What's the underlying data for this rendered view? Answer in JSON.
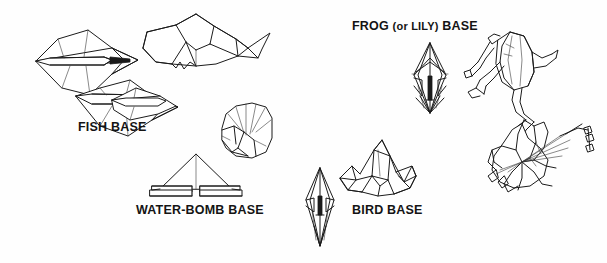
{
  "illustration": {
    "title": "Origami Bases",
    "background_color": "#fefefe",
    "ink_color": "#1b1b1b",
    "width": 607,
    "height": 263
  },
  "captions": {
    "fish_base": "FISH BASE",
    "water_bomb_base": "WATER-BOMB BASE",
    "bird_base": "BIRD BASE",
    "frog_base_full": "FROG (or LILY) BASE",
    "frog_base_part1": "FROG",
    "frog_base_part2": "(or LILY)",
    "frog_base_part3": "BASE"
  },
  "figures": [
    {
      "id": "fish-base-upper",
      "name": "fish-base-diagram-upper",
      "caption_group": "fish_base",
      "description": "Folded fish base, upper left, kite-shaped with central flap"
    },
    {
      "id": "fish-base-lower",
      "name": "fish-base-diagram-lower",
      "caption_group": "fish_base",
      "description": "Folded fish base, lower, kite-shaped with central flap"
    },
    {
      "id": "fish-model",
      "name": "fish-model-figure",
      "caption_group": "fish_base",
      "description": "Completed origami fish folded from the fish base"
    },
    {
      "id": "water-bomb-base",
      "name": "water-bomb-base-diagram",
      "caption_group": "water_bomb_base",
      "description": "Triangular water-bomb base with layered flaps"
    },
    {
      "id": "water-bomb-balloon",
      "name": "water-bomb-balloon-figure",
      "caption_group": "water_bomb_base",
      "description": "Inflated paper balloon folded from the water-bomb base"
    },
    {
      "id": "bird-base",
      "name": "bird-base-diagram",
      "caption_group": "bird_base",
      "description": "Slender diamond bird base with points"
    },
    {
      "id": "crane-model",
      "name": "crane-model-figure",
      "caption_group": "bird_base",
      "description": "Completed paper crane folded from the bird base"
    },
    {
      "id": "frog-base",
      "name": "frog-base-diagram",
      "caption_group": "frog_base",
      "description": "Multi-layered diamond frog (or lily) base"
    },
    {
      "id": "frog-model",
      "name": "frog-model-figure",
      "caption_group": "frog_base",
      "description": "Completed origami jumping frog folded from the frog base"
    },
    {
      "id": "lily-model",
      "name": "lily-model-figure",
      "caption_group": "frog_base",
      "description": "Completed origami lily flower folded from the frog base"
    }
  ]
}
